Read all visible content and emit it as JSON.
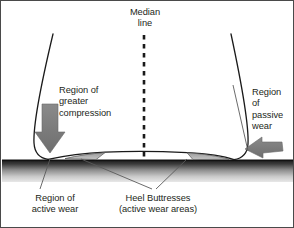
{
  "figure": {
    "kind": "anatomical-diagram",
    "background_color": "#ffffff",
    "border_color": "#4a4a4a",
    "text_color": "#231f20",
    "outline_color": "#1a1a1a",
    "arrow_color": "#7a7a7a",
    "wedge_color": "#b3b3b3",
    "ground_color": "#1d1d1d",
    "leader_color": "#5a5a5a"
  },
  "labels": {
    "median": "Median\nline",
    "compression": "Region of\ngreater\ncompression",
    "passive": "Region\nof\npassive\nwear",
    "active_wear": "Region of\nactive wear",
    "buttresses": "Heel Buttresses\n(active wear areas)"
  },
  "elements": {
    "median_line_name": "median-dashed-line",
    "left_arrow_name": "compression-arrow",
    "right_arrow_name": "passive-wear-arrow",
    "ground_name": "ground-surface",
    "shoe_name": "shoe-heel-outline",
    "left_wedge_name": "left-heel-buttress-wedge",
    "right_wedge_name": "right-heel-buttress-wedge"
  }
}
